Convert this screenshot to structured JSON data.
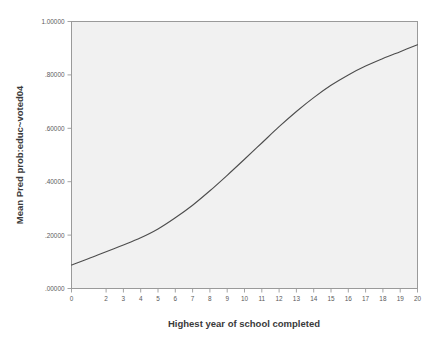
{
  "chart_data": {
    "type": "line",
    "title": "",
    "xlabel": "Highest year of school completed",
    "ylabel": "Mean Pred prob:educ~voted04",
    "xlim": [
      0,
      20
    ],
    "ylim": [
      0.0,
      1.0
    ],
    "grid": false,
    "legend": null,
    "x_tick_labels": [
      "0",
      "2",
      "3",
      "4",
      "5",
      "6",
      "7",
      "8",
      "9",
      "10",
      "11",
      "12",
      "13",
      "14",
      "15",
      "16",
      "17",
      "18",
      "19",
      "20"
    ],
    "x_tick_values": [
      0,
      2,
      3,
      4,
      5,
      6,
      7,
      8,
      9,
      10,
      11,
      12,
      13,
      14,
      15,
      16,
      17,
      18,
      19,
      20
    ],
    "y_tick_labels": [
      "1.00000",
      ".80000",
      ".60000",
      ".40000",
      ".20000",
      ".00000"
    ],
    "y_tick_values": [
      1.0,
      0.8,
      0.6,
      0.4,
      0.2,
      0.0
    ],
    "x": [
      0,
      1,
      2,
      3,
      4,
      5,
      6,
      7,
      8,
      9,
      10,
      11,
      12,
      13,
      14,
      15,
      16,
      17,
      18,
      19,
      20
    ],
    "values": [
      0.088,
      0.112,
      0.138,
      0.163,
      0.19,
      0.223,
      0.265,
      0.312,
      0.366,
      0.424,
      0.484,
      0.545,
      0.606,
      0.663,
      0.715,
      0.761,
      0.8,
      0.833,
      0.861,
      0.887,
      0.913
    ],
    "series": [
      {
        "name": "Mean Pred prob:educ~voted04",
        "values": [
          0.088,
          0.112,
          0.138,
          0.163,
          0.19,
          0.223,
          0.265,
          0.312,
          0.366,
          0.424,
          0.484,
          0.545,
          0.606,
          0.663,
          0.715,
          0.761,
          0.8,
          0.833,
          0.861,
          0.887,
          0.913
        ],
        "color": "#4d4d4d"
      }
    ],
    "colors": {
      "curve": "#4d4d4d",
      "plot_background": "#f1f1f1",
      "figure_background": "#ffffff",
      "frame": "#9a9a9a",
      "tick_label": "#5a5a5a",
      "axis_title": "#3a3a3a"
    }
  }
}
